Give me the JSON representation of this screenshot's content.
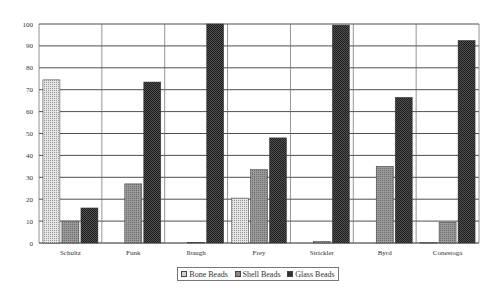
{
  "chart_data": {
    "type": "bar",
    "title": "",
    "xlabel": "",
    "ylabel": "",
    "ylim": [
      0,
      100
    ],
    "yticks": [
      0,
      10,
      20,
      30,
      40,
      50,
      60,
      70,
      80,
      90,
      100
    ],
    "grid": true,
    "legend_position": "bottom",
    "categories": [
      "Schultz",
      "Funk",
      "Ibaugh",
      "Frey",
      "Strickler",
      "Byrd",
      "Conestoga"
    ],
    "series": [
      {
        "name": "Bone Beads",
        "color": "#c8c8c8",
        "pattern": "light-dotted",
        "values": [
          74.5,
          0,
          0,
          20.5,
          0,
          0,
          0.2
        ]
      },
      {
        "name": "Shell Beads",
        "color": "#8a8a8a",
        "pattern": "medium",
        "values": [
          10,
          27,
          0.3,
          33.5,
          0.7,
          35,
          9.5
        ]
      },
      {
        "name": "Glass Beads",
        "color": "#3a3a3a",
        "pattern": "dark-checker",
        "values": [
          16,
          73.5,
          100,
          48,
          99.5,
          66.5,
          92.5
        ]
      }
    ]
  },
  "legend": {
    "items": [
      {
        "label": "Bone Beads"
      },
      {
        "label": "Shell Beads"
      },
      {
        "label": "Glass Beads"
      }
    ]
  }
}
